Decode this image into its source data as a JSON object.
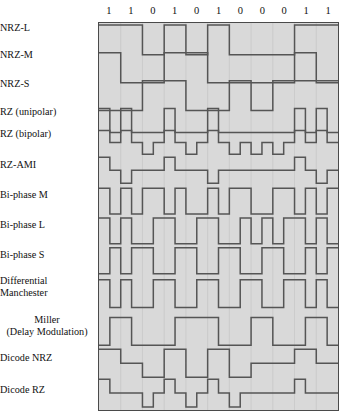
{
  "figure": {
    "bit_sequence": [
      "1",
      "1",
      "0",
      "1",
      "0",
      "1",
      "0",
      "0",
      "0",
      "1",
      "1"
    ],
    "bit_count": 11,
    "colors": {
      "panel_background": "#d9d9d9",
      "panel_border": "#4a4a4a",
      "waveform_stroke": "#555555",
      "gridline": "#c9c9c9",
      "page_background": "#ffffff",
      "text": "#111111"
    }
  },
  "rows": [
    {
      "id": "nrz-l",
      "label": "NRZ-L",
      "align": "left",
      "levels": 2,
      "label_y": 28,
      "track_top": 24,
      "track_height": 30
    },
    {
      "id": "nrz-m",
      "label": "NRZ-M",
      "align": "left",
      "levels": 2,
      "label_y": 55,
      "track_top": 52,
      "track_height": 30
    },
    {
      "id": "nrz-s",
      "label": "NRZ-S",
      "align": "left",
      "levels": 2,
      "label_y": 84,
      "track_top": 80,
      "track_height": 30
    },
    {
      "id": "rz-unipolar",
      "label": "RZ (unipolar)",
      "align": "left",
      "levels": 2,
      "label_y": 112,
      "track_top": 108,
      "track_height": 24
    },
    {
      "id": "rz-bipolar",
      "label": "RZ (bipolar)",
      "align": "left",
      "levels": 3,
      "label_y": 134,
      "track_top": 130,
      "track_height": 24
    },
    {
      "id": "rz-ami",
      "label": "RZ-AMI",
      "align": "left",
      "levels": 3,
      "label_y": 165,
      "track_top": 157,
      "track_height": 26
    },
    {
      "id": "bi-phase-m",
      "label": "Bi-phase M",
      "align": "left",
      "levels": 2,
      "label_y": 195,
      "track_top": 188,
      "track_height": 26
    },
    {
      "id": "bi-phase-l",
      "label": "Bi-phase L",
      "align": "left",
      "levels": 2,
      "label_y": 225,
      "track_top": 218,
      "track_height": 26
    },
    {
      "id": "bi-phase-s",
      "label": "Bi-phase S",
      "align": "left",
      "levels": 2,
      "label_y": 255,
      "track_top": 248,
      "track_height": 26
    },
    {
      "id": "diff-manch",
      "label": "Differential\nManchester",
      "align": "left",
      "levels": 2,
      "label_y": 281,
      "track_top": 280,
      "track_height": 28
    },
    {
      "id": "miller",
      "label": "Miller\n(Delay Modulation)",
      "align": "center",
      "levels": 2,
      "label_y": 320,
      "track_top": 318,
      "track_height": 28
    },
    {
      "id": "dicode-nrz",
      "label": "Dicode NRZ",
      "align": "left",
      "levels": 3,
      "label_y": 358,
      "track_top": 350,
      "track_height": 28
    },
    {
      "id": "dicode-rz",
      "label": "Dicode RZ",
      "align": "left",
      "levels": 3,
      "label_y": 390,
      "track_top": 380,
      "track_height": 28
    }
  ],
  "chart_data": {
    "type": "line",
    "xlabel": "",
    "ylabel": "",
    "x": [
      "1",
      "1",
      "0",
      "1",
      "0",
      "1",
      "0",
      "0",
      "0",
      "1",
      "1"
    ],
    "grid": true,
    "legend_position": "left-labels",
    "series": [
      {
        "name": "NRZ-L",
        "levels": 2,
        "half_bit_levels": [
          1,
          1,
          1,
          1,
          0,
          0,
          1,
          1,
          0,
          0,
          1,
          1,
          0,
          0,
          0,
          0,
          0,
          0,
          1,
          1,
          1,
          1
        ]
      },
      {
        "name": "NRZ-M",
        "levels": 2,
        "half_bit_levels": [
          1,
          1,
          0,
          0,
          0,
          0,
          1,
          1,
          1,
          1,
          0,
          0,
          0,
          0,
          0,
          0,
          0,
          0,
          1,
          1,
          0,
          0
        ]
      },
      {
        "name": "NRZ-S",
        "levels": 2,
        "half_bit_levels": [
          0,
          0,
          0,
          0,
          1,
          1,
          1,
          1,
          0,
          0,
          0,
          0,
          1,
          1,
          0,
          0,
          1,
          1,
          1,
          1,
          1,
          1
        ]
      },
      {
        "name": "RZ (unipolar)",
        "levels": 2,
        "half_bit_levels": [
          1,
          0,
          1,
          0,
          0,
          0,
          1,
          0,
          0,
          0,
          1,
          0,
          0,
          0,
          0,
          0,
          0,
          0,
          1,
          0,
          1,
          0
        ]
      },
      {
        "name": "RZ (bipolar)",
        "levels": 3,
        "half_bit_levels": [
          1,
          0,
          1,
          0,
          -1,
          0,
          1,
          0,
          -1,
          0,
          1,
          0,
          -1,
          0,
          -1,
          0,
          -1,
          0,
          1,
          0,
          1,
          0
        ]
      },
      {
        "name": "RZ-AMI",
        "levels": 3,
        "half_bit_levels": [
          1,
          0,
          -1,
          0,
          0,
          0,
          1,
          0,
          0,
          0,
          -1,
          0,
          0,
          0,
          0,
          0,
          0,
          0,
          1,
          0,
          -1,
          0
        ]
      },
      {
        "name": "Bi-phase M",
        "levels": 2,
        "half_bit_levels": [
          1,
          0,
          1,
          0,
          1,
          1,
          0,
          1,
          0,
          0,
          1,
          0,
          1,
          1,
          0,
          0,
          1,
          1,
          0,
          1,
          0,
          1
        ]
      },
      {
        "name": "Bi-phase L",
        "levels": 2,
        "half_bit_levels": [
          1,
          0,
          1,
          0,
          0,
          1,
          1,
          0,
          0,
          1,
          1,
          0,
          0,
          1,
          0,
          1,
          0,
          1,
          1,
          0,
          1,
          0
        ]
      },
      {
        "name": "Bi-phase S",
        "levels": 2,
        "half_bit_levels": [
          0,
          1,
          0,
          1,
          1,
          0,
          0,
          1,
          1,
          0,
          0,
          1,
          1,
          0,
          0,
          1,
          1,
          0,
          0,
          1,
          0,
          1
        ]
      },
      {
        "name": "Differential Manchester",
        "levels": 2,
        "half_bit_levels": [
          1,
          0,
          1,
          0,
          0,
          1,
          1,
          0,
          0,
          1,
          1,
          0,
          0,
          1,
          1,
          0,
          0,
          1,
          1,
          0,
          1,
          0
        ]
      },
      {
        "name": "Miller (Delay Modulation)",
        "levels": 2,
        "half_bit_levels": [
          0,
          1,
          1,
          0,
          0,
          0,
          0,
          1,
          1,
          1,
          1,
          0,
          0,
          0,
          1,
          1,
          0,
          0,
          0,
          1,
          1,
          0
        ]
      },
      {
        "name": "Dicode NRZ",
        "levels": 3,
        "half_bit_levels": [
          1,
          1,
          0,
          0,
          -1,
          -1,
          1,
          1,
          -1,
          -1,
          1,
          1,
          -1,
          -1,
          0,
          0,
          0,
          0,
          1,
          1,
          0,
          0
        ]
      },
      {
        "name": "Dicode RZ",
        "levels": 3,
        "half_bit_levels": [
          1,
          0,
          0,
          0,
          -1,
          0,
          1,
          0,
          -1,
          0,
          1,
          0,
          -1,
          0,
          0,
          0,
          0,
          0,
          1,
          0,
          0,
          0
        ]
      }
    ]
  }
}
